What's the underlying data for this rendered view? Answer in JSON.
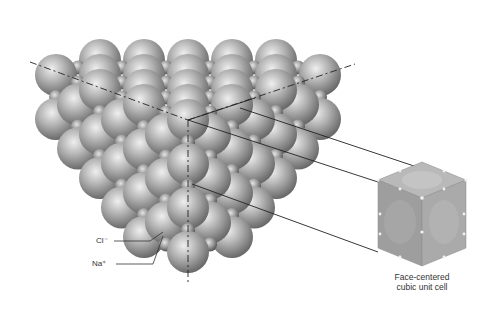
{
  "figure": {
    "labels": {
      "chloride": "Cl⁻",
      "sodium": "Na⁺"
    },
    "unit_cell_caption_line1": "Face-centered",
    "unit_cell_caption_line2": "cubic unit cell"
  },
  "colors": {
    "background": "#ffffff",
    "large_ion_light": "#e8e8e8",
    "large_ion_dark": "#6e6e6e",
    "small_ion_light": "#dcdcdc",
    "small_ion_dark": "#5a5a5a",
    "lines": "#222222",
    "cube_face_top": "#b8b8b8",
    "cube_face_left": "#9a9a9a",
    "cube_face_right": "#a8a8a8"
  }
}
